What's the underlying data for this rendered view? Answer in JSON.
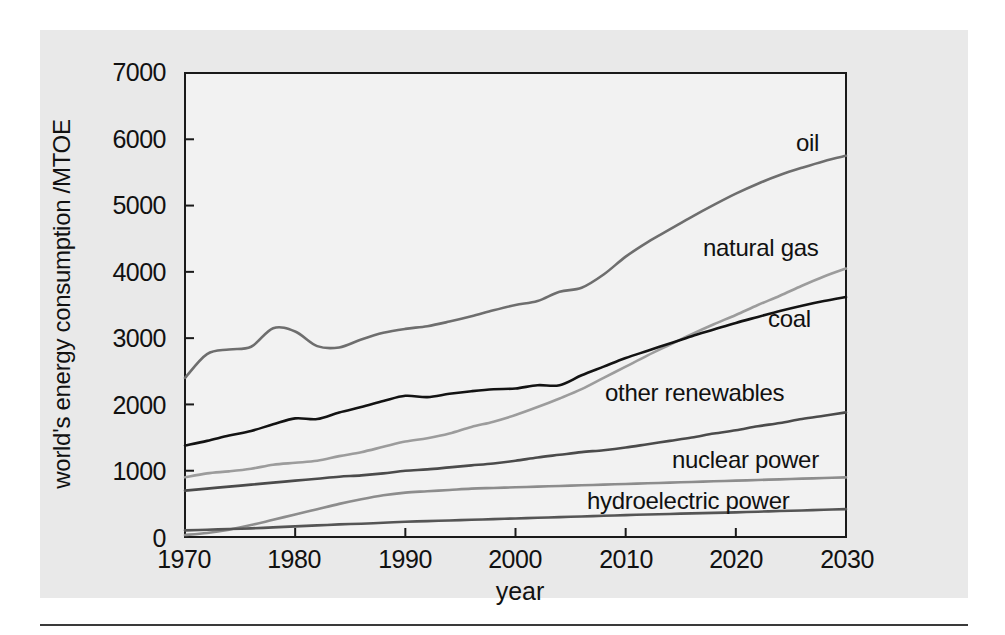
{
  "figure": {
    "panel_background": "#e9e9e9",
    "plot_background": "#f2f2f2",
    "axis_color": "#1a1a1a"
  },
  "axes": {
    "ylabel": "world's energy consumption /MTOE",
    "xlabel": "year",
    "y_ticks": [
      "0",
      "1000",
      "2000",
      "3000",
      "4000",
      "5000",
      "6000",
      "7000"
    ],
    "x_ticks": [
      "1970",
      "1980",
      "1990",
      "2000",
      "2010",
      "2020",
      "2030"
    ]
  },
  "labels": {
    "oil": "oil",
    "natural_gas": "natural gas",
    "coal": "coal",
    "other_renewables": "other renewables",
    "nuclear_power": "nuclear power",
    "hydroelectric_power": "hydroelectric power"
  },
  "chart_data": {
    "type": "line",
    "title": "",
    "subtitle": "",
    "xlabel": "year",
    "ylabel": "world's energy consumption /MTOE",
    "xlim": [
      1970,
      2030
    ],
    "ylim": [
      0,
      7000
    ],
    "xticks": [
      1970,
      1980,
      1990,
      2000,
      2010,
      2020,
      2030
    ],
    "yticks": [
      0,
      1000,
      2000,
      3000,
      4000,
      5000,
      6000,
      7000
    ],
    "grid": false,
    "legend": "inline-right-labels",
    "x": [
      1970,
      1972,
      1974,
      1976,
      1978,
      1980,
      1982,
      1984,
      1986,
      1988,
      1990,
      1992,
      1994,
      1996,
      1998,
      2000,
      2002,
      2004,
      2006,
      2008,
      2010,
      2012,
      2014,
      2016,
      2018,
      2020,
      2022,
      2024,
      2026,
      2028,
      2030
    ],
    "series": [
      {
        "name": "oil",
        "color": "#6e6e6e",
        "values": [
          2400,
          2760,
          2830,
          2870,
          3150,
          3100,
          2880,
          2860,
          2980,
          3080,
          3140,
          3180,
          3250,
          3330,
          3420,
          3500,
          3560,
          3700,
          3760,
          3960,
          4230,
          4450,
          4640,
          4830,
          5010,
          5180,
          5330,
          5460,
          5570,
          5670,
          5750
        ]
      },
      {
        "name": "natural gas",
        "color": "#9c9c9c",
        "values": [
          900,
          960,
          990,
          1030,
          1090,
          1120,
          1150,
          1220,
          1280,
          1360,
          1440,
          1490,
          1560,
          1660,
          1740,
          1840,
          1960,
          2090,
          2230,
          2400,
          2570,
          2740,
          2900,
          3060,
          3210,
          3350,
          3500,
          3640,
          3790,
          3930,
          4050
        ]
      },
      {
        "name": "coal",
        "color": "#131313",
        "values": [
          1380,
          1450,
          1530,
          1600,
          1700,
          1790,
          1780,
          1880,
          1960,
          2050,
          2130,
          2110,
          2160,
          2200,
          2230,
          2240,
          2290,
          2290,
          2440,
          2570,
          2700,
          2810,
          2920,
          3030,
          3130,
          3230,
          3320,
          3410,
          3490,
          3560,
          3620
        ]
      },
      {
        "name": "other renewables",
        "color": "#4b4b4b",
        "values": [
          700,
          730,
          760,
          790,
          820,
          850,
          880,
          910,
          930,
          960,
          1000,
          1020,
          1050,
          1080,
          1110,
          1150,
          1200,
          1240,
          1280,
          1310,
          1350,
          1400,
          1450,
          1500,
          1560,
          1610,
          1670,
          1720,
          1780,
          1830,
          1880
        ]
      },
      {
        "name": "nuclear power",
        "color": "#8d8d8d",
        "values": [
          30,
          60,
          110,
          180,
          260,
          340,
          420,
          500,
          570,
          630,
          670,
          690,
          710,
          730,
          740,
          750,
          760,
          770,
          780,
          790,
          800,
          810,
          820,
          830,
          840,
          850,
          860,
          870,
          880,
          890,
          900
        ]
      },
      {
        "name": "hydroelectric power",
        "color": "#555555",
        "values": [
          100,
          110,
          120,
          130,
          145,
          160,
          175,
          190,
          200,
          215,
          230,
          240,
          250,
          260,
          270,
          280,
          290,
          300,
          310,
          320,
          330,
          340,
          348,
          356,
          364,
          372,
          382,
          392,
          400,
          410,
          420
        ]
      }
    ]
  }
}
